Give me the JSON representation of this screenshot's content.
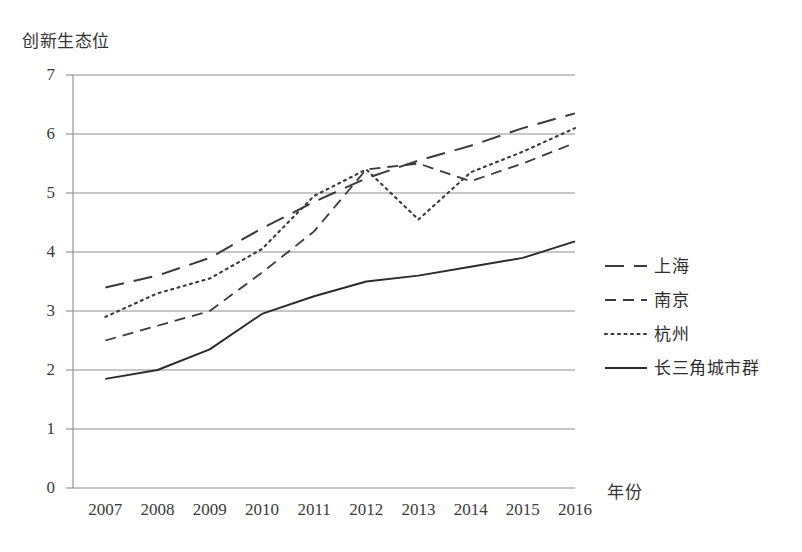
{
  "chart_data": {
    "type": "line",
    "title": "",
    "xlabel": "年份",
    "ylabel": "创新生态位",
    "x": [
      2007,
      2008,
      2009,
      2010,
      2011,
      2012,
      2013,
      2014,
      2015,
      2016
    ],
    "categories": [
      "2007",
      "2008",
      "2009",
      "2010",
      "2011",
      "2012",
      "2013",
      "2014",
      "2015",
      "2016"
    ],
    "ylim": [
      0,
      7
    ],
    "yticks": [
      0,
      1,
      2,
      3,
      4,
      5,
      6,
      7
    ],
    "ytick_labels": [
      "0",
      "1",
      "2",
      "3",
      "4",
      "5",
      "6",
      "7"
    ],
    "grid": "horizontal",
    "legend_position": "right",
    "series": [
      {
        "name": "上海",
        "style": "long-dash",
        "color": "#3a3a3a",
        "values": [
          3.4,
          3.6,
          3.9,
          4.4,
          4.85,
          5.25,
          5.55,
          5.8,
          6.1,
          6.35
        ]
      },
      {
        "name": "南京",
        "style": "dashed",
        "color": "#3a3a3a",
        "values": [
          2.5,
          2.75,
          3.0,
          3.65,
          4.35,
          5.4,
          5.5,
          5.2,
          5.5,
          5.85
        ]
      },
      {
        "name": "杭州",
        "style": "dotted",
        "color": "#3a3a3a",
        "values": [
          2.9,
          3.3,
          3.55,
          4.05,
          4.95,
          5.4,
          4.55,
          5.35,
          5.7,
          6.1
        ]
      },
      {
        "name": "长三角城市群",
        "style": "solid",
        "color": "#2b2b2b",
        "values": [
          1.85,
          2.0,
          2.35,
          2.95,
          3.25,
          3.5,
          3.6,
          3.75,
          3.9,
          4.18
        ]
      }
    ]
  },
  "axes": {
    "y_title": "创新生态位",
    "x_title": "年份"
  },
  "legend": {
    "items": [
      {
        "label": "上海"
      },
      {
        "label": "南京"
      },
      {
        "label": "杭州"
      },
      {
        "label": "长三角城市群"
      }
    ]
  }
}
